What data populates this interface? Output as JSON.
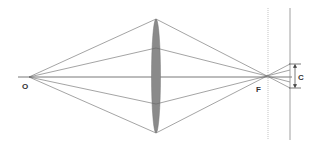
{
  "diagram": {
    "title": "",
    "labels": {
      "object_point": "O",
      "focal_point": "F",
      "circle_of_confusion": "C"
    },
    "colors": {
      "ray": "#666666",
      "axis": "#555555",
      "lens_fill": "#8a8a8a",
      "dotted_plane": "#aaaaaa",
      "sensor_plane": "#888888"
    }
  }
}
